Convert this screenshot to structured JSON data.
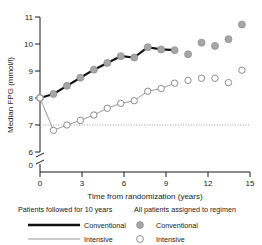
{
  "chart_data": {
    "type": "line",
    "title": "",
    "xlabel": "Time from randomization (years)",
    "ylabel": "Median FPG (mmol/l)",
    "xlim": [
      0,
      15.6
    ],
    "ylim": [
      5.85,
      11.05
    ],
    "xticks": [
      0,
      3,
      6,
      9,
      12,
      15
    ],
    "xticklabels": [
      "0",
      "3",
      "6",
      "9",
      "12",
      "15"
    ],
    "yticks": [
      6,
      7,
      8,
      9,
      10,
      11
    ],
    "yticklabels": [
      "6",
      "7",
      "8",
      "9",
      "10",
      "11"
    ],
    "y_axis_break": true,
    "y_axis_break_label": "0",
    "grid": false,
    "reference_line": {
      "y": 7,
      "style": "dotted",
      "color": "#999999"
    },
    "legend_position": "below-plot",
    "series": [
      {
        "name": "Conventional",
        "group": "Patients followed for 10 years",
        "marker": "filled-circle",
        "marker_color": "#a6a6a6",
        "line": "thick-solid",
        "line_color": "#111111",
        "x": [
          0,
          1,
          2,
          3,
          4,
          5,
          6,
          7,
          8,
          9,
          10
        ],
        "y": [
          8.0,
          8.15,
          8.45,
          8.75,
          9.05,
          9.3,
          9.55,
          9.5,
          9.88,
          9.8,
          9.77
        ]
      },
      {
        "name": "Intensive",
        "group": "Patients followed for 10 years",
        "marker": "open-circle",
        "marker_color": "#ffffff",
        "marker_edge": "#8c8c8c",
        "line": "thin-solid",
        "line_color": "#999999",
        "x": [
          0,
          1,
          2,
          3,
          4,
          5,
          6,
          7,
          8,
          9,
          10
        ],
        "y": [
          8.0,
          6.8,
          7.0,
          7.17,
          7.37,
          7.62,
          7.8,
          7.9,
          8.25,
          8.35,
          8.55
        ]
      },
      {
        "name": "Conventional",
        "group": "All patients assigned to regimen",
        "marker": "filled-circle",
        "marker_color": "#a6a6a6",
        "line": "none",
        "x": [
          11,
          12,
          13,
          14,
          15
        ],
        "y": [
          9.62,
          10.05,
          9.93,
          10.18,
          10.72
        ]
      },
      {
        "name": "Intensive",
        "group": "All patients assigned to regimen",
        "marker": "open-circle",
        "marker_color": "#ffffff",
        "marker_edge": "#8c8c8c",
        "line": "none",
        "x": [
          11,
          12,
          13,
          14,
          15
        ],
        "y": [
          8.65,
          8.73,
          8.73,
          8.57,
          9.03
        ]
      }
    ]
  },
  "axes": {
    "ylabel": "Median FPG (mmol/l)",
    "xlabel": "Time from randomization (years)",
    "break_label": "0",
    "yticklabels": [
      "11",
      "10",
      "9",
      "8",
      "7",
      "6"
    ],
    "xticklabels": [
      "0",
      "3",
      "6",
      "9",
      "12",
      "15"
    ]
  },
  "legend": {
    "left_header": "Patients followed for 10 years",
    "right_header": "All patients assigned to regimen",
    "rows": [
      {
        "left_label": "Conventional",
        "right_label": "Conventional"
      },
      {
        "left_label": "Intensive",
        "right_label": "Intensive"
      }
    ]
  }
}
